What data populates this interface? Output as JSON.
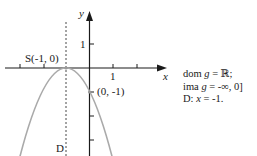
{
  "graph": {
    "function_name": "g",
    "formula": "g(x) = -(x+1)^2",
    "origin_px": [
      89,
      68
    ],
    "unit_px": 24,
    "x_axis_label": "x",
    "y_axis_label": "y",
    "x_tick_label": "1",
    "y_tick_label": "1",
    "vertex_label": "S(-1, 0)",
    "intercept_label": "(0, -1)",
    "axis_of_symmetry_label": "D",
    "curve_color": "#aaaaaa",
    "axis_color": "#1a1a1a"
  },
  "info": {
    "line1_prefix": "dom ",
    "line1_var": "g",
    "line1_suffix": " = ℝ;",
    "line2_prefix": "ima ",
    "line2_var": "g",
    "line2_suffix": " = -∞, 0]",
    "line3_prefix": "D: ",
    "line3_var": "x",
    "line3_suffix": " = -1."
  }
}
